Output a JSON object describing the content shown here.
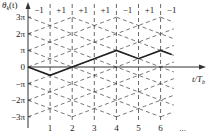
{
  "chart_data": {
    "type": "line",
    "ylabel": "θk(t)",
    "xlabel": "t/Tb",
    "x_ticks": [
      "1",
      "2",
      "3",
      "4",
      "5",
      "6",
      "..."
    ],
    "y_ticks": [
      "3π",
      "2π",
      "π",
      "0",
      "−π",
      "−2π",
      "−3π"
    ],
    "bits": [
      "−1",
      "+1",
      "+1",
      "+1",
      "−1",
      "+1",
      "−1"
    ],
    "path": {
      "x": [
        0,
        1,
        2,
        3,
        4,
        5,
        6,
        6.5
      ],
      "y_in_pi": [
        0,
        -0.5,
        0,
        0.5,
        1,
        0.5,
        1,
        0.75
      ]
    },
    "ylim_in_pi": [
      -3,
      3
    ],
    "xlim": [
      0,
      7
    ],
    "grid": "dashed trellis lines with slope ±π/2 per Tb"
  },
  "labels": {
    "y_axis": "θ",
    "y_axis_sub": "k",
    "y_axis_arg": "(t)",
    "x_axis": "t/T",
    "x_axis_sub": "b",
    "ellipsis": "···"
  }
}
